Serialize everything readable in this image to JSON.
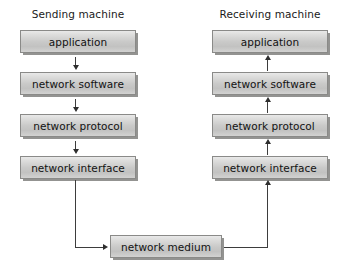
{
  "diagram": {
    "columns": [
      {
        "id": "sending",
        "heading": "Sending machine",
        "flow_direction": "down",
        "layers": [
          {
            "label": "application"
          },
          {
            "label": "network software"
          },
          {
            "label": "network protocol"
          },
          {
            "label": "network interface"
          }
        ]
      },
      {
        "id": "receiving",
        "heading": "Receiving machine",
        "flow_direction": "up",
        "layers": [
          {
            "label": "application"
          },
          {
            "label": "network software"
          },
          {
            "label": "network protocol"
          },
          {
            "label": "network interface"
          }
        ]
      }
    ],
    "medium": {
      "label": "network medium"
    },
    "colors": {
      "box_fill_top": "#e9e9e9",
      "box_fill_bottom": "#c2c2c1",
      "box_border": "#8a8a88",
      "box_shadow": "#50504e",
      "arrow": "#2e2e2e",
      "text": "#121212",
      "background": "#ffffff"
    }
  }
}
